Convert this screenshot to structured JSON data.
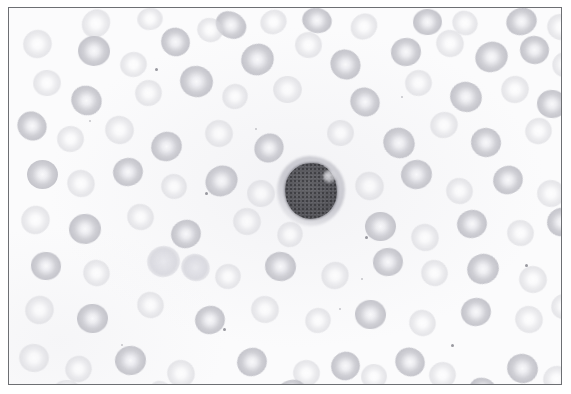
{
  "figure": {
    "caption": "",
    "border_color": "#6d6f73",
    "background_color": "#fbfbfc",
    "outer_margin_color": "#ffffff",
    "frame": {
      "x": 8,
      "y": 7,
      "width": 554,
      "height": 378
    }
  },
  "specimen": {
    "stain": "Romanowsky (grayscale reproduction)",
    "field_description": "Numerous pale erythrocytes with central pallor surrounding a single darkly stained mononuclear leukocyte",
    "erythrocyte_color": "#d6d6db",
    "erythrocyte_center_color": "#fafafb",
    "leukocyte_nucleus_color": "#555559",
    "leukocyte_cytoplasm_color": "#c6c6cd",
    "speck_color": "#9a9aa2"
  },
  "leukocyte": {
    "label": "lymphocyte",
    "center_x": 302,
    "center_y": 183,
    "nucleus_width": 52,
    "nucleus_height": 56,
    "cell_width": 68,
    "cell_height": 70
  },
  "erythrocytes": [
    {
      "x": 72,
      "y": 2,
      "w": 30,
      "h": 27,
      "style": "faint"
    },
    {
      "x": 128,
      "y": 0,
      "w": 26,
      "h": 22,
      "style": "faint"
    },
    {
      "x": 206,
      "y": 4,
      "w": 32,
      "h": 26,
      "style": "deep"
    },
    {
      "x": 251,
      "y": 2,
      "w": 27,
      "h": 24,
      "style": "faint"
    },
    {
      "x": 293,
      "y": 0,
      "w": 30,
      "h": 25,
      "style": "deep"
    },
    {
      "x": 341,
      "y": 6,
      "w": 28,
      "h": 25,
      "style": "faint"
    },
    {
      "x": 404,
      "y": 1,
      "w": 29,
      "h": 26,
      "style": "deep"
    },
    {
      "x": 443,
      "y": 3,
      "w": 26,
      "h": 24,
      "style": "faint"
    },
    {
      "x": 497,
      "y": 0,
      "w": 31,
      "h": 27,
      "style": "deep"
    },
    {
      "x": 538,
      "y": 6,
      "w": 28,
      "h": 26,
      "style": "faint"
    },
    {
      "x": 14,
      "y": 22,
      "w": 29,
      "h": 28,
      "style": "faint"
    },
    {
      "x": 69,
      "y": 28,
      "w": 32,
      "h": 30,
      "style": "deep"
    },
    {
      "x": 152,
      "y": 20,
      "w": 29,
      "h": 28,
      "style": "deep"
    },
    {
      "x": 111,
      "y": 44,
      "w": 27,
      "h": 25,
      "style": "faint"
    },
    {
      "x": 188,
      "y": 10,
      "w": 26,
      "h": 24,
      "style": "faint"
    },
    {
      "x": 232,
      "y": 36,
      "w": 33,
      "h": 31,
      "style": "deep"
    },
    {
      "x": 286,
      "y": 24,
      "w": 27,
      "h": 26,
      "style": "faint"
    },
    {
      "x": 321,
      "y": 42,
      "w": 31,
      "h": 29,
      "style": "deep"
    },
    {
      "x": 382,
      "y": 30,
      "w": 30,
      "h": 28,
      "style": "deep"
    },
    {
      "x": 427,
      "y": 22,
      "w": 28,
      "h": 27,
      "style": "faint"
    },
    {
      "x": 466,
      "y": 34,
      "w": 33,
      "h": 30,
      "style": "deep"
    },
    {
      "x": 511,
      "y": 28,
      "w": 29,
      "h": 28,
      "style": "deep"
    },
    {
      "x": 543,
      "y": 44,
      "w": 26,
      "h": 25,
      "style": "faint"
    },
    {
      "x": 24,
      "y": 62,
      "w": 28,
      "h": 26,
      "style": "faint"
    },
    {
      "x": 62,
      "y": 78,
      "w": 31,
      "h": 29,
      "style": "deep"
    },
    {
      "x": 126,
      "y": 72,
      "w": 27,
      "h": 26,
      "style": "faint"
    },
    {
      "x": 171,
      "y": 58,
      "w": 33,
      "h": 31,
      "style": "deep"
    },
    {
      "x": 213,
      "y": 76,
      "w": 26,
      "h": 25,
      "style": "faint"
    },
    {
      "x": 264,
      "y": 68,
      "w": 29,
      "h": 27,
      "style": "faint"
    },
    {
      "x": 341,
      "y": 80,
      "w": 30,
      "h": 28,
      "style": "deep"
    },
    {
      "x": 396,
      "y": 62,
      "w": 27,
      "h": 26,
      "style": "faint"
    },
    {
      "x": 441,
      "y": 74,
      "w": 32,
      "h": 30,
      "style": "deep"
    },
    {
      "x": 492,
      "y": 68,
      "w": 28,
      "h": 27,
      "style": "faint"
    },
    {
      "x": 528,
      "y": 82,
      "w": 30,
      "h": 28,
      "style": "deep"
    },
    {
      "x": 8,
      "y": 104,
      "w": 30,
      "h": 28,
      "style": "deep"
    },
    {
      "x": 48,
      "y": 118,
      "w": 27,
      "h": 26,
      "style": "faint"
    },
    {
      "x": 96,
      "y": 108,
      "w": 29,
      "h": 28,
      "style": "faint"
    },
    {
      "x": 142,
      "y": 124,
      "w": 31,
      "h": 29,
      "style": "deep"
    },
    {
      "x": 196,
      "y": 112,
      "w": 28,
      "h": 27,
      "style": "faint"
    },
    {
      "x": 245,
      "y": 126,
      "w": 30,
      "h": 28,
      "style": "deep"
    },
    {
      "x": 318,
      "y": 112,
      "w": 27,
      "h": 26,
      "style": "faint"
    },
    {
      "x": 374,
      "y": 120,
      "w": 32,
      "h": 30,
      "style": "deep"
    },
    {
      "x": 421,
      "y": 104,
      "w": 28,
      "h": 26,
      "style": "faint"
    },
    {
      "x": 462,
      "y": 120,
      "w": 30,
      "h": 29,
      "style": "deep"
    },
    {
      "x": 516,
      "y": 110,
      "w": 27,
      "h": 26,
      "style": "faint"
    },
    {
      "x": 18,
      "y": 152,
      "w": 31,
      "h": 29,
      "style": "deep"
    },
    {
      "x": 58,
      "y": 162,
      "w": 28,
      "h": 27,
      "style": "faint"
    },
    {
      "x": 104,
      "y": 150,
      "w": 30,
      "h": 28,
      "style": "deep"
    },
    {
      "x": 152,
      "y": 166,
      "w": 26,
      "h": 25,
      "style": "faint"
    },
    {
      "x": 196,
      "y": 158,
      "w": 33,
      "h": 30,
      "style": "deep"
    },
    {
      "x": 238,
      "y": 172,
      "w": 28,
      "h": 27,
      "style": "faint"
    },
    {
      "x": 346,
      "y": 164,
      "w": 29,
      "h": 28,
      "style": "faint"
    },
    {
      "x": 392,
      "y": 152,
      "w": 31,
      "h": 29,
      "style": "deep"
    },
    {
      "x": 437,
      "y": 170,
      "w": 27,
      "h": 26,
      "style": "faint"
    },
    {
      "x": 484,
      "y": 158,
      "w": 30,
      "h": 28,
      "style": "deep"
    },
    {
      "x": 528,
      "y": 172,
      "w": 28,
      "h": 27,
      "style": "faint"
    },
    {
      "x": 12,
      "y": 198,
      "w": 29,
      "h": 28,
      "style": "faint"
    },
    {
      "x": 60,
      "y": 206,
      "w": 32,
      "h": 30,
      "style": "deep"
    },
    {
      "x": 118,
      "y": 196,
      "w": 27,
      "h": 26,
      "style": "faint"
    },
    {
      "x": 162,
      "y": 212,
      "w": 30,
      "h": 28,
      "style": "deep"
    },
    {
      "x": 224,
      "y": 200,
      "w": 28,
      "h": 27,
      "style": "faint"
    },
    {
      "x": 268,
      "y": 214,
      "w": 26,
      "h": 25,
      "style": "faint"
    },
    {
      "x": 356,
      "y": 204,
      "w": 31,
      "h": 29,
      "style": "deep"
    },
    {
      "x": 402,
      "y": 216,
      "w": 28,
      "h": 27,
      "style": "faint"
    },
    {
      "x": 448,
      "y": 202,
      "w": 30,
      "h": 28,
      "style": "deep"
    },
    {
      "x": 498,
      "y": 212,
      "w": 27,
      "h": 26,
      "style": "faint"
    },
    {
      "x": 538,
      "y": 200,
      "w": 29,
      "h": 28,
      "style": "deep"
    },
    {
      "x": 22,
      "y": 244,
      "w": 30,
      "h": 28,
      "style": "deep"
    },
    {
      "x": 74,
      "y": 252,
      "w": 27,
      "h": 26,
      "style": "faint"
    },
    {
      "x": 138,
      "y": 238,
      "w": 33,
      "h": 31,
      "style": "blob"
    },
    {
      "x": 172,
      "y": 246,
      "w": 29,
      "h": 27,
      "style": "blob"
    },
    {
      "x": 206,
      "y": 256,
      "w": 26,
      "h": 25,
      "style": "faint"
    },
    {
      "x": 256,
      "y": 244,
      "w": 31,
      "h": 29,
      "style": "deep"
    },
    {
      "x": 312,
      "y": 254,
      "w": 28,
      "h": 27,
      "style": "faint"
    },
    {
      "x": 364,
      "y": 240,
      "w": 30,
      "h": 28,
      "style": "deep"
    },
    {
      "x": 412,
      "y": 252,
      "w": 27,
      "h": 26,
      "style": "faint"
    },
    {
      "x": 458,
      "y": 246,
      "w": 32,
      "h": 30,
      "style": "deep"
    },
    {
      "x": 510,
      "y": 258,
      "w": 28,
      "h": 27,
      "style": "faint"
    },
    {
      "x": 16,
      "y": 288,
      "w": 29,
      "h": 28,
      "style": "faint"
    },
    {
      "x": 68,
      "y": 296,
      "w": 31,
      "h": 29,
      "style": "deep"
    },
    {
      "x": 128,
      "y": 284,
      "w": 27,
      "h": 26,
      "style": "faint"
    },
    {
      "x": 186,
      "y": 298,
      "w": 30,
      "h": 28,
      "style": "deep"
    },
    {
      "x": 242,
      "y": 288,
      "w": 28,
      "h": 27,
      "style": "faint"
    },
    {
      "x": 296,
      "y": 300,
      "w": 26,
      "h": 25,
      "style": "faint"
    },
    {
      "x": 346,
      "y": 292,
      "w": 31,
      "h": 29,
      "style": "deep"
    },
    {
      "x": 400,
      "y": 302,
      "w": 27,
      "h": 26,
      "style": "faint"
    },
    {
      "x": 452,
      "y": 290,
      "w": 30,
      "h": 28,
      "style": "deep"
    },
    {
      "x": 506,
      "y": 298,
      "w": 28,
      "h": 27,
      "style": "faint"
    },
    {
      "x": 542,
      "y": 286,
      "w": 26,
      "h": 25,
      "style": "faint"
    },
    {
      "x": 10,
      "y": 336,
      "w": 30,
      "h": 28,
      "style": "faint"
    },
    {
      "x": 56,
      "y": 348,
      "w": 27,
      "h": 26,
      "style": "faint"
    },
    {
      "x": 106,
      "y": 338,
      "w": 31,
      "h": 29,
      "style": "deep"
    },
    {
      "x": 158,
      "y": 352,
      "w": 28,
      "h": 27,
      "style": "faint"
    },
    {
      "x": 228,
      "y": 340,
      "w": 30,
      "h": 28,
      "style": "deep"
    },
    {
      "x": 284,
      "y": 352,
      "w": 27,
      "h": 26,
      "style": "faint"
    },
    {
      "x": 322,
      "y": 344,
      "w": 29,
      "h": 28,
      "style": "deep"
    },
    {
      "x": 352,
      "y": 356,
      "w": 26,
      "h": 25,
      "style": "faint"
    },
    {
      "x": 386,
      "y": 340,
      "w": 30,
      "h": 28,
      "style": "deep"
    },
    {
      "x": 420,
      "y": 354,
      "w": 27,
      "h": 26,
      "style": "faint"
    },
    {
      "x": 498,
      "y": 346,
      "w": 31,
      "h": 29,
      "style": "deep"
    },
    {
      "x": 534,
      "y": 358,
      "w": 27,
      "h": 26,
      "style": "faint"
    },
    {
      "x": 44,
      "y": 372,
      "w": 28,
      "h": 22,
      "style": "faint"
    },
    {
      "x": 140,
      "y": 374,
      "w": 26,
      "h": 20,
      "style": "faint"
    },
    {
      "x": 268,
      "y": 372,
      "w": 29,
      "h": 22,
      "style": "deep"
    },
    {
      "x": 460,
      "y": 370,
      "w": 28,
      "h": 24,
      "style": "deep"
    }
  ],
  "specks": [
    {
      "x": 146,
      "y": 60,
      "w": 3,
      "h": 3,
      "style": "dark"
    },
    {
      "x": 80,
      "y": 112,
      "w": 2,
      "h": 2,
      "style": ""
    },
    {
      "x": 196,
      "y": 184,
      "w": 3,
      "h": 3,
      "style": "dark"
    },
    {
      "x": 246,
      "y": 120,
      "w": 2,
      "h": 2,
      "style": ""
    },
    {
      "x": 214,
      "y": 320,
      "w": 3,
      "h": 3,
      "style": "dark"
    },
    {
      "x": 330,
      "y": 300,
      "w": 2,
      "h": 2,
      "style": ""
    },
    {
      "x": 442,
      "y": 336,
      "w": 3,
      "h": 3,
      "style": "dark"
    },
    {
      "x": 356,
      "y": 228,
      "w": 3,
      "h": 3,
      "style": "dark"
    },
    {
      "x": 352,
      "y": 270,
      "w": 2,
      "h": 2,
      "style": ""
    },
    {
      "x": 516,
      "y": 256,
      "w": 3,
      "h": 3,
      "style": "dark"
    },
    {
      "x": 112,
      "y": 336,
      "w": 2,
      "h": 2,
      "style": ""
    },
    {
      "x": 392,
      "y": 88,
      "w": 2,
      "h": 2,
      "style": ""
    }
  ]
}
